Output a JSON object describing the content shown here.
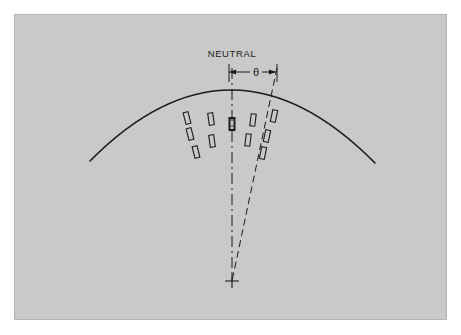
{
  "figure": {
    "panel": {
      "background_color": "#c9c9c9",
      "border_color": "#b4b4b4",
      "outer_background_color": "#ffffff"
    },
    "line_color": "#1a1a1a"
  },
  "labels": {
    "neutral": "NEUTRAL",
    "angle_symbol": "θ"
  },
  "chart_data": {
    "type": "diagram",
    "annotations": [
      {
        "name": "neutral-label",
        "text": "NEUTRAL",
        "x": 232,
        "y": 57
      },
      {
        "name": "angle-label",
        "text": "θ",
        "x": 256,
        "y": 72
      }
    ],
    "elements": {
      "arc": {
        "name": "curved-surface-arc",
        "start": [
          90,
          161
        ],
        "apex": [
          232,
          90
        ],
        "end": [
          375,
          163
        ],
        "stroke_width": 1.6
      },
      "neutral_axis": {
        "name": "neutral-centerline",
        "style": "dash-dot",
        "from": [
          232,
          68
        ],
        "to": [
          232,
          281
        ]
      },
      "angled_ray": {
        "name": "inclined-ray",
        "style": "dashed",
        "from": [
          277,
          68
        ],
        "to": [
          232,
          281
        ],
        "angle_deg": 12
      },
      "center_mark": {
        "name": "center-of-curvature-cross",
        "x": 232,
        "y": 281,
        "size": 7
      },
      "dimension_line": {
        "name": "angle-dimension-line",
        "y": 72,
        "from_x": 229,
        "to_x": 276,
        "extension_ticks": [
          {
            "x": 229,
            "y1": 64,
            "y2": 82
          },
          {
            "x": 277,
            "y1": 64,
            "y2": 82
          }
        ]
      }
    },
    "markers": {
      "name": "rectangular-markers",
      "width": 5,
      "height": 12,
      "center_marker": {
        "cx": 232,
        "cy": 124,
        "rot": 0,
        "emphasis": true
      },
      "left_group": [
        {
          "cx": 187,
          "cy": 118,
          "rot": -14
        },
        {
          "cx": 190,
          "cy": 134,
          "rot": -14
        },
        {
          "cx": 196,
          "cy": 152,
          "rot": -14
        },
        {
          "cx": 211,
          "cy": 119,
          "rot": -8
        },
        {
          "cx": 212,
          "cy": 141,
          "rot": -8
        }
      ],
      "right_group": [
        {
          "cx": 253,
          "cy": 120,
          "rot": 7
        },
        {
          "cx": 248,
          "cy": 140,
          "rot": 7
        }
      ],
      "ray_group": [
        {
          "cx": 274,
          "cy": 116,
          "rot": 12
        },
        {
          "cx": 267,
          "cy": 136,
          "rot": 12
        },
        {
          "cx": 263,
          "cy": 153,
          "rot": 12
        }
      ]
    }
  }
}
